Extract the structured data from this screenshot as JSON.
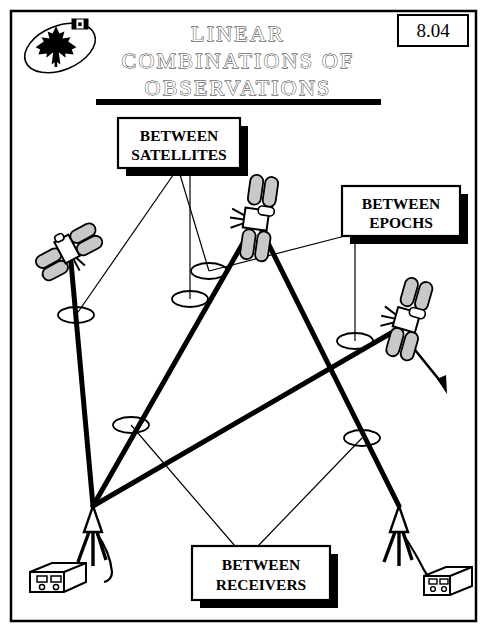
{
  "page": {
    "number": "8.04",
    "title_lines": [
      "LINEAR",
      "COMBINATIONS OF",
      "OBSERVATIONS"
    ],
    "title_full": "LINEAR COMBINATIONS OF OBSERVATIONS",
    "border_color": "#000000",
    "background_color": "#ffffff",
    "ink_color": "#000000",
    "panel_fill": "#d4d4d4"
  },
  "logo": {
    "name": "canada-maple-leaf-emblem",
    "description": "maple leaf inside tilted ellipse with small canadian flag"
  },
  "callouts": [
    {
      "id": "between-satellites",
      "lines": [
        "BETWEEN",
        "SATELLITES"
      ],
      "x": 118,
      "y": 118,
      "w": 122,
      "h": 50
    },
    {
      "id": "between-epochs",
      "lines": [
        "BETWEEN",
        "EPOCHS"
      ],
      "x": 342,
      "y": 186,
      "w": 118,
      "h": 50
    },
    {
      "id": "between-receivers",
      "lines": [
        "BETWEEN",
        "RECEIVERS"
      ],
      "x": 192,
      "y": 546,
      "w": 138,
      "h": 54
    }
  ],
  "satellites": [
    {
      "id": "satellite-left",
      "label": "satellite",
      "x": 67,
      "y": 249,
      "rotate": -28
    },
    {
      "id": "satellite-top",
      "label": "satellite",
      "x": 255,
      "y": 219,
      "rotate": 8
    },
    {
      "id": "satellite-right",
      "label": "satellite",
      "x": 407,
      "y": 320,
      "rotate": 16
    }
  ],
  "receivers": [
    {
      "id": "receiver-left",
      "label": "receiver station",
      "antenna_x": 93,
      "antenna_y": 506,
      "box_x": 30,
      "box_y": 564
    },
    {
      "id": "receiver-right",
      "label": "receiver station",
      "antenna_x": 399,
      "antenna_y": 506,
      "box_x": 424,
      "box_y": 568
    }
  ],
  "signal_paths": [
    {
      "from": "receiver-left",
      "to": "satellite-left"
    },
    {
      "from": "receiver-left",
      "to": "satellite-top"
    },
    {
      "from": "receiver-left",
      "to": "satellite-right"
    },
    {
      "from": "receiver-right",
      "to": "satellite-top"
    }
  ],
  "difference_markers": [
    {
      "id": "marker-sat-left-path",
      "x": 76,
      "y": 315
    },
    {
      "id": "marker-sat-mid-upper",
      "x": 209,
      "y": 271
    },
    {
      "id": "marker-sat-mid-lower",
      "x": 190,
      "y": 299
    },
    {
      "id": "marker-epoch-right",
      "x": 355,
      "y": 341
    },
    {
      "id": "marker-recv-left",
      "x": 131,
      "y": 425
    },
    {
      "id": "marker-recv-right",
      "x": 362,
      "y": 438
    }
  ]
}
